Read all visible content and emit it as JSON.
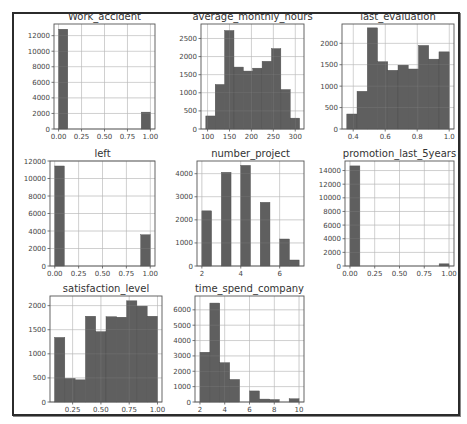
{
  "colors": {
    "bar": "#5f5f5f",
    "grid": "#d6d6d6",
    "frame": "#2b2b2b"
  },
  "chart_data": [
    {
      "type": "bar",
      "title": "Work_accident",
      "frame": [
        54,
        24,
        155,
        129
      ],
      "xlim": [
        -0.05,
        1.05
      ],
      "ylim": [
        0,
        13500
      ],
      "xticks": [
        0.0,
        0.25,
        0.5,
        0.75,
        1.0
      ],
      "xtick_labels": [
        "0.00",
        "0.25",
        "0.50",
        "0.75",
        "1.00"
      ],
      "yticks": [
        0,
        2000,
        4000,
        6000,
        8000,
        10000,
        12000
      ],
      "ytick_labels": [
        "0",
        "2000",
        "4000",
        "6000",
        "8000",
        "10000",
        "12000"
      ],
      "bins": [
        [
          0.0,
          0.1,
          12830
        ],
        [
          0.1,
          0.2,
          0
        ],
        [
          0.2,
          0.3,
          0
        ],
        [
          0.3,
          0.4,
          0
        ],
        [
          0.4,
          0.5,
          0
        ],
        [
          0.5,
          0.6,
          0
        ],
        [
          0.6,
          0.7,
          0
        ],
        [
          0.7,
          0.8,
          0
        ],
        [
          0.8,
          0.9,
          0
        ],
        [
          0.9,
          1.0,
          2169
        ]
      ]
    },
    {
      "type": "bar",
      "title": "average_monthly_hours",
      "frame": [
        201,
        24,
        304,
        129
      ],
      "xlim": [
        85,
        320
      ],
      "ylim": [
        0,
        2900
      ],
      "xticks": [
        100,
        150,
        200,
        250,
        300
      ],
      "xtick_labels": [
        "100",
        "150",
        "200",
        "250",
        "300"
      ],
      "yticks": [
        0,
        500,
        1000,
        1500,
        2000,
        2500
      ],
      "ytick_labels": [
        "0",
        "500",
        "1000",
        "1500",
        "2000",
        "2500"
      ],
      "bins": [
        [
          96,
          117.4,
          360
        ],
        [
          117.4,
          138.8,
          1230
        ],
        [
          138.8,
          160.2,
          2720
        ],
        [
          160.2,
          181.6,
          1710
        ],
        [
          181.6,
          203,
          1600
        ],
        [
          203,
          224.4,
          1680
        ],
        [
          224.4,
          245.8,
          1870
        ],
        [
          245.8,
          267.2,
          2220
        ],
        [
          267.2,
          288.6,
          1090
        ],
        [
          288.6,
          310,
          300
        ]
      ]
    },
    {
      "type": "bar",
      "title": "last_evaluation",
      "frame": [
        342,
        24,
        454,
        129
      ],
      "xlim": [
        0.33,
        1.03
      ],
      "ylim": [
        0,
        2450
      ],
      "xticks": [
        0.4,
        0.6,
        0.8,
        1.0
      ],
      "xtick_labels": [
        "0.4",
        "0.6",
        "0.8",
        "1.0"
      ],
      "yticks": [
        0,
        500,
        1000,
        1500,
        2000
      ],
      "ytick_labels": [
        "0",
        "500",
        "1000",
        "1500",
        "2000"
      ],
      "bins": [
        [
          0.36,
          0.424,
          350
        ],
        [
          0.424,
          0.488,
          880
        ],
        [
          0.488,
          0.552,
          2360
        ],
        [
          0.552,
          0.616,
          1570
        ],
        [
          0.616,
          0.68,
          1370
        ],
        [
          0.68,
          0.744,
          1490
        ],
        [
          0.744,
          0.808,
          1400
        ],
        [
          0.808,
          0.872,
          1950
        ],
        [
          0.872,
          0.936,
          1630
        ],
        [
          0.936,
          1.0,
          1800
        ]
      ]
    },
    {
      "type": "bar",
      "title": "left",
      "frame": [
        50,
        161,
        155,
        266
      ],
      "xlim": [
        -0.05,
        1.05
      ],
      "ylim": [
        0,
        12000
      ],
      "xticks": [
        0.0,
        0.25,
        0.5,
        0.75,
        1.0
      ],
      "xtick_labels": [
        "0.00",
        "0.25",
        "0.50",
        "0.75",
        "1.00"
      ],
      "yticks": [
        0,
        2000,
        4000,
        6000,
        8000,
        10000,
        12000
      ],
      "ytick_labels": [
        "0",
        "2000",
        "4000",
        "6000",
        "8000",
        "10000",
        "12000"
      ],
      "bins": [
        [
          0.0,
          0.1,
          11430
        ],
        [
          0.1,
          0.2,
          0
        ],
        [
          0.2,
          0.3,
          0
        ],
        [
          0.3,
          0.4,
          0
        ],
        [
          0.4,
          0.5,
          0
        ],
        [
          0.5,
          0.6,
          0
        ],
        [
          0.6,
          0.7,
          0
        ],
        [
          0.7,
          0.8,
          0
        ],
        [
          0.8,
          0.9,
          0
        ],
        [
          0.9,
          1.0,
          3570
        ]
      ]
    },
    {
      "type": "bar",
      "title": "number_project",
      "frame": [
        197,
        161,
        304,
        266
      ],
      "xlim": [
        1.75,
        7.25
      ],
      "ylim": [
        0,
        4550
      ],
      "xticks": [
        2,
        4,
        6
      ],
      "xtick_labels": [
        "2",
        "4",
        "6"
      ],
      "yticks": [
        0,
        1000,
        2000,
        3000,
        4000
      ],
      "ytick_labels": [
        "0",
        "1000",
        "2000",
        "3000",
        "4000"
      ],
      "bins": [
        [
          2.0,
          2.5,
          2390
        ],
        [
          2.5,
          3.0,
          0
        ],
        [
          3.0,
          3.5,
          4060
        ],
        [
          3.5,
          4.0,
          0
        ],
        [
          4.0,
          4.5,
          4360
        ],
        [
          4.5,
          5.0,
          0
        ],
        [
          5.0,
          5.5,
          2760
        ],
        [
          5.5,
          6.0,
          0
        ],
        [
          6.0,
          6.5,
          1170
        ],
        [
          6.5,
          7.0,
          260
        ]
      ]
    },
    {
      "type": "bar",
      "title": "promotion_last_5years",
      "frame": [
        345,
        161,
        454,
        266
      ],
      "xlim": [
        -0.05,
        1.05
      ],
      "ylim": [
        0,
        15400
      ],
      "xticks": [
        0.0,
        0.25,
        0.5,
        0.75,
        1.0
      ],
      "xtick_labels": [
        "0.00",
        "0.25",
        "0.50",
        "0.75",
        "1.00"
      ],
      "yticks": [
        0,
        2000,
        4000,
        6000,
        8000,
        10000,
        12000,
        14000
      ],
      "ytick_labels": [
        "0",
        "2000",
        "4000",
        "6000",
        "8000",
        "10000",
        "12000",
        "14000"
      ],
      "bins": [
        [
          0.0,
          0.1,
          14680
        ],
        [
          0.1,
          0.2,
          0
        ],
        [
          0.2,
          0.3,
          0
        ],
        [
          0.3,
          0.4,
          0
        ],
        [
          0.4,
          0.5,
          0
        ],
        [
          0.5,
          0.6,
          0
        ],
        [
          0.6,
          0.7,
          0
        ],
        [
          0.7,
          0.8,
          0
        ],
        [
          0.8,
          0.9,
          0
        ],
        [
          0.9,
          1.0,
          319
        ]
      ]
    },
    {
      "type": "bar",
      "title": "satisfaction_level",
      "frame": [
        50,
        296,
        162,
        402
      ],
      "xlim": [
        0.05,
        1.04
      ],
      "ylim": [
        0,
        2200
      ],
      "xticks": [
        0.25,
        0.5,
        0.75,
        1.0
      ],
      "xtick_labels": [
        "0.25",
        "0.50",
        "0.75",
        "1.00"
      ],
      "yticks": [
        0,
        500,
        1000,
        1500,
        2000
      ],
      "ytick_labels": [
        "0",
        "500",
        "1000",
        "1500",
        "2000"
      ],
      "bins": [
        [
          0.09,
          0.181,
          1340
        ],
        [
          0.181,
          0.272,
          490
        ],
        [
          0.272,
          0.363,
          460
        ],
        [
          0.363,
          0.454,
          1780
        ],
        [
          0.454,
          0.545,
          1460
        ],
        [
          0.545,
          0.636,
          1770
        ],
        [
          0.636,
          0.727,
          1760
        ],
        [
          0.727,
          0.818,
          2100
        ],
        [
          0.818,
          0.909,
          1990
        ],
        [
          0.909,
          1.0,
          1780
        ]
      ]
    },
    {
      "type": "bar",
      "title": "time_spend_company",
      "frame": [
        195,
        296,
        304,
        402
      ],
      "xlim": [
        1.6,
        10.4
      ],
      "ylim": [
        0,
        6900
      ],
      "xticks": [
        2,
        4,
        6,
        8,
        10
      ],
      "xtick_labels": [
        "2",
        "4",
        "6",
        "8",
        "10"
      ],
      "yticks": [
        0,
        1000,
        2000,
        3000,
        4000,
        5000,
        6000
      ],
      "ytick_labels": [
        "0",
        "1000",
        "2000",
        "3000",
        "4000",
        "5000",
        "6000"
      ],
      "bins": [
        [
          2.0,
          2.8,
          3240
        ],
        [
          2.8,
          3.6,
          6440
        ],
        [
          3.6,
          4.4,
          2560
        ],
        [
          4.4,
          5.2,
          1470
        ],
        [
          5.2,
          6.0,
          0
        ],
        [
          6.0,
          6.8,
          720
        ],
        [
          6.8,
          7.6,
          190
        ],
        [
          7.6,
          8.4,
          160
        ],
        [
          8.4,
          9.2,
          0
        ],
        [
          9.2,
          10.0,
          210
        ]
      ]
    }
  ]
}
